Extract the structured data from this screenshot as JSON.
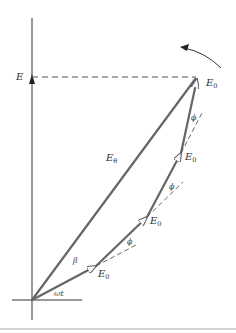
{
  "diagram": {
    "type": "phasor-diagram",
    "labels": {
      "vertical_axis": "E",
      "resultant": "E",
      "resultant_sub": "θ",
      "phasor": "E",
      "phasor_sub": "0",
      "phase_step": "ϕ",
      "resultant_angle": "β",
      "rotation_angle": "ωt"
    },
    "phasors": [
      {
        "label": "E",
        "sub": "0"
      },
      {
        "label": "E",
        "sub": "0"
      },
      {
        "label": "E",
        "sub": "0"
      },
      {
        "label": "E",
        "sub": "0"
      }
    ],
    "angle_markers": [
      "ϕ",
      "ϕ",
      "ϕ"
    ],
    "colors": {
      "phasor_line": "#666666",
      "axis_line": "#333333",
      "dashed_line": "#555555",
      "text": "#333333"
    }
  }
}
